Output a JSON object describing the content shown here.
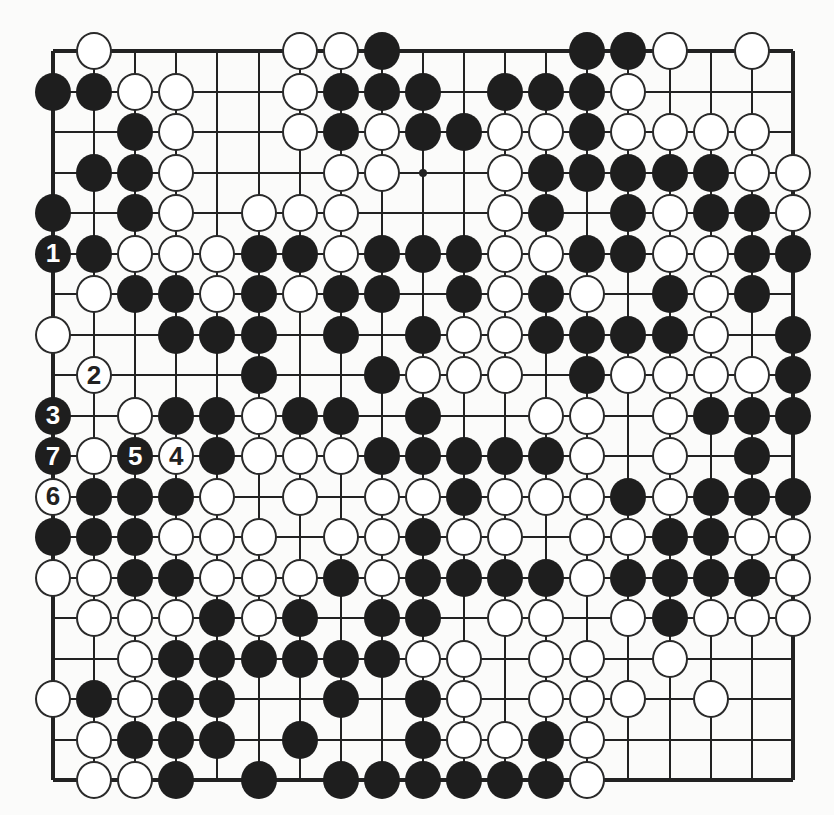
{
  "board": {
    "size": 19,
    "rows": [
      "-W----WWB----BBW-W-",
      "BBWW--WBBB-BBBW----",
      "--BW--WBWBBWWBWWWW-",
      "-BBW---WW--WBBBBBWW",
      "B-BW-WWW---WB-BWBBW",
      "BBWWWBBWBBBWWBBWWBB",
      "-WBBWBWBB-BWBW-BWB-",
      "W--BBB-B-BWWBBBBW-B",
      "-W---B--BWWW-BWWWWB",
      "B-WBBWBB-B--WW-WBBB",
      "BWBWBWWWBBBBBW-W-B-",
      "WBBBW-W-WWBWWWBWBBB",
      "BBBWWW-WWBWW-WWBBWW",
      "WWBBWWWBWBBBBWBBBBW",
      "-WWWBWB-BB-WW-WBWWW",
      "--WBBBBBBWW-WW-W---",
      "WBWBB--B-BW-WWW-W--",
      "-WBBB-B--BWWBW-----",
      "-WWB-B-BBBBBBW-----"
    ],
    "numbered_moves": [
      {
        "n": "1",
        "color": "B",
        "row": 5,
        "col": 0
      },
      {
        "n": "2",
        "color": "W",
        "row": 8,
        "col": 1
      },
      {
        "n": "3",
        "color": "B",
        "row": 9,
        "col": 0
      },
      {
        "n": "4",
        "color": "W",
        "row": 10,
        "col": 3
      },
      {
        "n": "5",
        "color": "B",
        "row": 10,
        "col": 2
      },
      {
        "n": "6",
        "color": "W",
        "row": 11,
        "col": 0
      },
      {
        "n": "7",
        "color": "B",
        "row": 10,
        "col": 0
      }
    ],
    "star_points": [
      [
        3,
        9
      ]
    ],
    "colors": {
      "black": "#1e1e1e",
      "white": "#ffffff",
      "line": "#222222"
    }
  }
}
